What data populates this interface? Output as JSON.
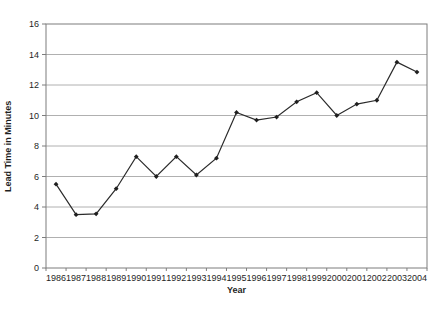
{
  "chart_data": {
    "type": "line",
    "title": "",
    "xlabel": "Year",
    "ylabel": "Lead Time in Minutes",
    "x": [
      "1986",
      "1987",
      "1988",
      "1989",
      "1990",
      "1991",
      "1992",
      "1993",
      "1994",
      "1995",
      "1996",
      "1997",
      "1998",
      "1999",
      "2000",
      "2001",
      "2002",
      "2003",
      "2004"
    ],
    "series": [
      {
        "name": "Lead Time",
        "values": [
          5.5,
          3.5,
          3.55,
          5.2,
          7.3,
          6.0,
          7.3,
          6.1,
          7.2,
          10.2,
          9.7,
          9.9,
          10.9,
          11.5,
          10.0,
          10.75,
          11.0,
          13.5,
          12.85
        ]
      }
    ],
    "ylim": [
      0,
      16
    ],
    "ytick_step": 2,
    "yticks": [
      "0",
      "2",
      "4",
      "6",
      "8",
      "10",
      "12",
      "14",
      "16"
    ],
    "grid": true,
    "legend_position": "none",
    "marker": "diamond",
    "colors": {
      "line": "#2b2b2b",
      "marker": "#1f1f1f",
      "grid": "#b0b0b0",
      "axis": "#7d7d7d",
      "text": "#1f1f1f",
      "background": "#ffffff"
    }
  }
}
